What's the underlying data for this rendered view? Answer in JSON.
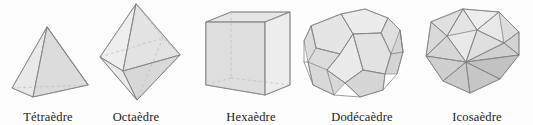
{
  "figure": {
    "background_color": "#fdfdfd",
    "caption_color": "#1b1b1b",
    "edge_color": "#7e7e7e",
    "hidden_edge_color": "#b9b9b9",
    "face_fill_light": "#f2f2f2",
    "face_fill_mid": "#e4e4e4",
    "face_fill_dark": "#d2d2d2"
  },
  "solids": [
    {
      "id": "tetrahedron",
      "label": "Tétraèdre",
      "faces": 4,
      "face_shape": "triangle",
      "label_center_x": 48,
      "label_y": 110
    },
    {
      "id": "octahedron",
      "label": "Octaèdre",
      "faces": 8,
      "face_shape": "triangle",
      "label_center_x": 136,
      "label_y": 110
    },
    {
      "id": "hexahedron",
      "label": "Hexaèdre",
      "faces": 6,
      "face_shape": "square",
      "label_center_x": 251,
      "label_y": 110
    },
    {
      "id": "dodecahedron",
      "label": "Dodécaèdre",
      "faces": 12,
      "face_shape": "pentagon",
      "label_center_x": 362,
      "label_y": 110
    },
    {
      "id": "icosahedron",
      "label": "Icosaèdre",
      "faces": 20,
      "face_shape": "triangle",
      "label_center_x": 477,
      "label_y": 110
    }
  ]
}
